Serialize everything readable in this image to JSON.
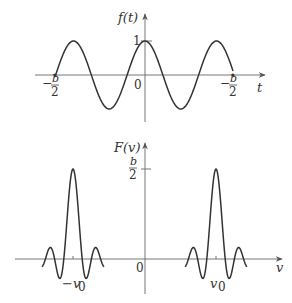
{
  "top_plot": {
    "ylabel": "f(t)",
    "xlabel": "t",
    "origin": "0",
    "ytick": "1",
    "left_tick": {
      "sign": "−",
      "num": "b",
      "den": "2"
    },
    "right_tick": {
      "sign": "−",
      "num": "b",
      "den": "2"
    }
  },
  "bottom_plot": {
    "ylabel": "F(v)",
    "xlabel": "v",
    "origin": "0",
    "ytick": {
      "num": "b",
      "den": "2"
    },
    "left_peak_label": "−v",
    "left_peak_sub": "0",
    "right_peak_label": "v",
    "right_peak_sub": "0"
  },
  "chart_data": [
    {
      "type": "line",
      "title": "f(t) = cos(2π v0 t), truncated to [−b/2, b/2]",
      "xlabel": "t",
      "ylabel": "f(t)",
      "x_ticks": [
        "−b/2",
        "0",
        "−b/2"
      ],
      "y_ticks": [
        "1"
      ],
      "series": [
        {
          "name": "f(t)",
          "description": "cosine, amplitude 1, 2.5 periods across window, peak at t=0"
        }
      ]
    },
    {
      "type": "line",
      "title": "F(v): sinc lobes at ±v0",
      "xlabel": "v",
      "ylabel": "F(v)",
      "x_ticks": [
        "−v0",
        "0",
        "v0"
      ],
      "y_ticks": [
        "b/2"
      ],
      "series": [
        {
          "name": "F(v)",
          "description": "two sinc functions of peak height b/2 centered at −v0 and v0"
        }
      ]
    }
  ]
}
